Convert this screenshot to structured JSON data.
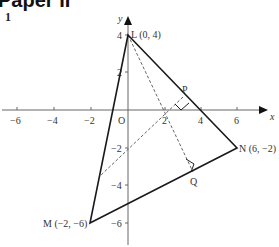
{
  "header": {
    "title": "Paper II",
    "question_number": "1"
  },
  "diagram": {
    "axes": {
      "x_label": "x",
      "y_label": "y",
      "origin_label": "O",
      "x_ticks": [
        "−6",
        "−4",
        "−2",
        "2",
        "4",
        "6"
      ],
      "y_ticks": [
        "4",
        "2",
        "−2",
        "−4",
        "−6"
      ]
    },
    "points": {
      "L": "L (0, 4)",
      "M": "M (−2, −6)",
      "N": "N (6, −2)",
      "P": "P",
      "Q": "Q"
    },
    "colors": {
      "line": "#1a1a1a",
      "axis": "#555555",
      "dashed": "#666666"
    }
  }
}
